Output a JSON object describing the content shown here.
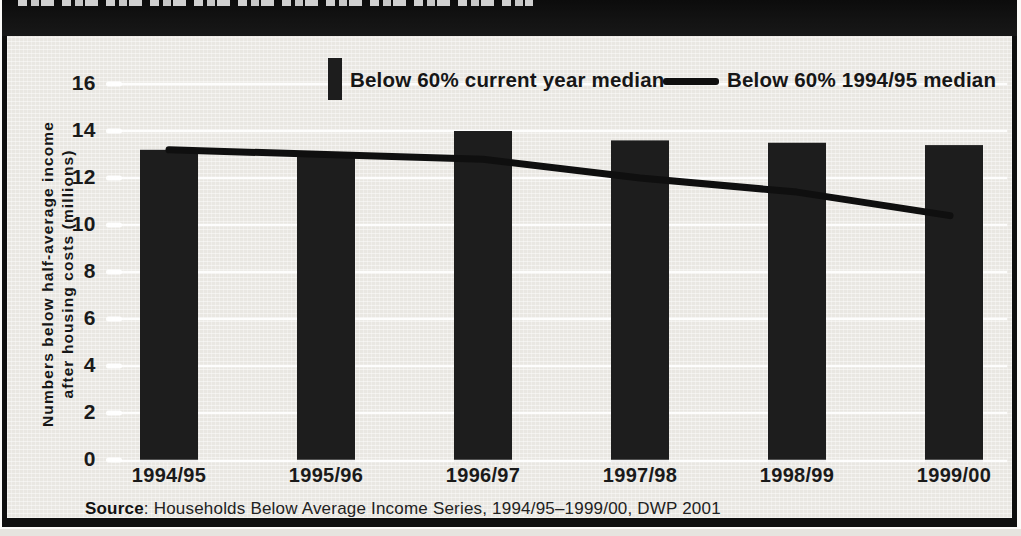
{
  "header": {
    "note": "clipped-illegible-title-band"
  },
  "chart_data": {
    "type": "bar",
    "categories": [
      "1994/95",
      "1995/96",
      "1996/97",
      "1997/98",
      "1998/99",
      "1999/00"
    ],
    "series": [
      {
        "name": "Below 60% current year median",
        "type": "bar",
        "values": [
          13.2,
          13.0,
          14.0,
          13.6,
          13.5,
          13.4
        ]
      },
      {
        "name": "Below 60% 1994/95 median",
        "type": "line",
        "values": [
          13.2,
          13.0,
          12.8,
          12.0,
          11.4,
          10.4
        ]
      }
    ],
    "title": "",
    "xlabel": "",
    "ylabel_lines": [
      "Numbers below half-average income",
      "after housing costs (millions)"
    ],
    "ylim": [
      0,
      16
    ],
    "yticks": [
      0,
      2,
      4,
      6,
      8,
      10,
      12,
      14,
      16
    ],
    "grid": true,
    "legend_position": "top",
    "colors": {
      "bar": "#1d1d1d",
      "line": "#0f0f0f",
      "grid": "#ffffff",
      "panel_bg": "#e9e7e2",
      "band": "#0f0f0f",
      "text": "#1a1a1a"
    }
  },
  "legend": {
    "bar_label": "Below 60% current year median",
    "line_label": "Below 60% 1994/95 median"
  },
  "source": {
    "label": "Source",
    "text": ": Households Below Average Income Series, 1994/95–1999/00, DWP 2001"
  }
}
